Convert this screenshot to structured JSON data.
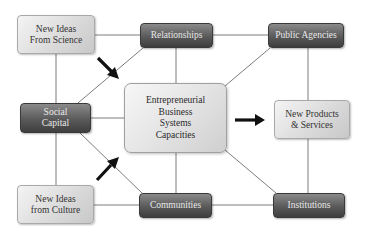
{
  "diagram": {
    "nodes": {
      "science": {
        "line1": "New Ideas",
        "line2": "From Science"
      },
      "relationships": {
        "label": "Relationships"
      },
      "public_agencies": {
        "label": "Public Agencies"
      },
      "social_capital": {
        "line1": "Social",
        "line2": "Capital"
      },
      "center": {
        "line1": "Entrepreneurial",
        "line2": "Business",
        "line3": "Systems",
        "line4": "Capacities"
      },
      "products": {
        "line1": "New Products",
        "line2": "& Services"
      },
      "culture": {
        "line1": "New Ideas",
        "line2": "from Culture"
      },
      "communities": {
        "label": "Communities"
      },
      "institutions": {
        "label": "Institutions"
      }
    },
    "colors": {
      "line": "#6e6e6e",
      "arrow": "#111111"
    },
    "arrows": [
      {
        "from": "science",
        "to": "center",
        "icon": "arrow-down-right-icon"
      },
      {
        "from": "culture",
        "to": "center",
        "icon": "arrow-up-right-icon"
      },
      {
        "from": "center",
        "to": "products",
        "icon": "arrow-right-icon"
      }
    ]
  }
}
